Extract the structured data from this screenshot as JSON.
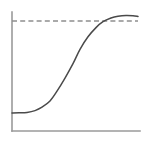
{
  "figure": {
    "background_color": "#ffffff",
    "width": 146,
    "height": 141
  },
  "chart_data": {
    "type": "line",
    "title": "",
    "subtitle": "",
    "xlabel": "",
    "ylabel": "",
    "xlim": [
      0,
      1
    ],
    "ylim": [
      0,
      1
    ],
    "grid": false,
    "legend": null,
    "xticks": [],
    "yticks": [],
    "xticklabels": [],
    "yticklabels": [],
    "axes": {
      "style": "L-shaped open spines (left and bottom only)",
      "color": "#9a9a9a",
      "left_spine_x_px": 12,
      "left_spine_y_range_px": [
        12,
        131
      ],
      "bottom_spine_y_px": 131,
      "bottom_spine_x_range_px": [
        12,
        140
      ]
    },
    "series": [
      {
        "name": "sigmoid-curve",
        "style": "solid",
        "color": "#4a4a4a",
        "description": "S-shaped logistic growth curve rising from a low plateau to an upper plateau just below the asymptote",
        "x": [
          0.0,
          0.06,
          0.12,
          0.18,
          0.24,
          0.3,
          0.36,
          0.42,
          0.48,
          0.54,
          0.6,
          0.66,
          0.72,
          0.78,
          0.84,
          0.9,
          0.96,
          1.0
        ],
        "y": [
          0.15,
          0.152,
          0.158,
          0.172,
          0.198,
          0.245,
          0.32,
          0.42,
          0.53,
          0.64,
          0.735,
          0.805,
          0.85,
          0.878,
          0.892,
          0.898,
          0.896,
          0.89
        ],
        "points_px": [
          [
            12,
            113
          ],
          [
            19,
            112.8
          ],
          [
            27,
            112.4
          ],
          [
            35,
            110.6
          ],
          [
            42,
            107.2
          ],
          [
            50,
            101.0
          ],
          [
            57,
            91.2
          ],
          [
            65,
            78.1
          ],
          [
            73,
            63.7
          ],
          [
            80,
            49.3
          ],
          [
            88,
            36.8
          ],
          [
            96,
            27.6
          ],
          [
            103,
            21.7
          ],
          [
            111,
            18.0
          ],
          [
            118,
            16.2
          ],
          [
            126,
            15.4
          ],
          [
            133,
            15.7
          ],
          [
            138,
            16.5
          ]
        ]
      },
      {
        "name": "asymptote",
        "style": "dashed",
        "color": "#8e8e8e",
        "description": "Horizontal dashed reference line marking the upper asymptote / carrying capacity",
        "y_value": 1.0,
        "y_px": 21,
        "x_range_px": [
          12,
          138
        ]
      }
    ],
    "annotations": []
  }
}
